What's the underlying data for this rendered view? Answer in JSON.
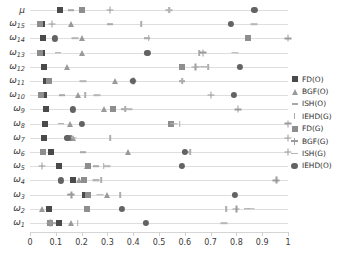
{
  "chart_data": {
    "type": "scatter",
    "title": "",
    "xlabel": "",
    "ylabel": "",
    "xlim": [
      0,
      1
    ],
    "xticks": [
      "0",
      "0.1",
      "0.2",
      "0.3",
      "0.4",
      "0.5",
      "0.6",
      "0.7",
      "0.8",
      "0.9",
      "1"
    ],
    "grid": true,
    "legend_position": "right",
    "categories": [
      "μ",
      "ω₁₅",
      "ω₁₄",
      "ω₁₃",
      "ω₁₂",
      "ω₁₁",
      "ω₁₀",
      "ω₉",
      "ω₈",
      "ω₇",
      "ω₆",
      "ω₅",
      "ω₄",
      "ω₃",
      "ω₂",
      "ω₁"
    ],
    "category_labels": [
      {
        "base": "μ",
        "sub": ""
      },
      {
        "base": "ω",
        "sub": "15"
      },
      {
        "base": "ω",
        "sub": "14"
      },
      {
        "base": "ω",
        "sub": "13"
      },
      {
        "base": "ω",
        "sub": "12"
      },
      {
        "base": "ω",
        "sub": "11"
      },
      {
        "base": "ω",
        "sub": "10"
      },
      {
        "base": "ω",
        "sub": "9"
      },
      {
        "base": "ω",
        "sub": "8"
      },
      {
        "base": "ω",
        "sub": "7"
      },
      {
        "base": "ω",
        "sub": "6"
      },
      {
        "base": "ω",
        "sub": "5"
      },
      {
        "base": "ω",
        "sub": "4"
      },
      {
        "base": "ω",
        "sub": "3"
      },
      {
        "base": "ω",
        "sub": "2"
      },
      {
        "base": "ω",
        "sub": "1"
      }
    ],
    "series": [
      {
        "name": "FD(O)",
        "marker": "square",
        "color": "#4a4a4a",
        "values": [
          0.115,
          0.045,
          0.05,
          0.047,
          0.055,
          0.063,
          0.053,
          0.062,
          0.06,
          0.053,
          0.08,
          0.112,
          0.165,
          0.215,
          0.073,
          0.112
        ]
      },
      {
        "name": "BGF(O)",
        "marker": "triangle",
        "color": "#9a9a9a",
        "values": [
          0.2,
          0.16,
          0.2,
          0.2,
          0.145,
          0.33,
          0.185,
          0.285,
          0.155,
          0.165,
          0.38,
          0.22,
          0.19,
          0.3,
          0.045,
          0.16
        ]
      },
      {
        "name": "ISH(O)",
        "marker": "dash",
        "color": "#a8a8a8",
        "values": [
          0.16,
          0.31,
          0.455,
          0.11,
          0.675,
          0.59,
          0.125,
          0.365,
          0.12,
          0.145,
          0.205,
          0.255,
          0.255,
          0.155,
          0.84,
          0.088
        ]
      },
      {
        "name": "IEHD(G)",
        "marker": "tick",
        "color": "#adadad",
        "values": [
          0.54,
          0.43,
          0.46,
          0.655,
          0.69,
          0.59,
          0.215,
          0.37,
          0.58,
          0.31,
          0.62,
          0.285,
          0.275,
          0.35,
          0.76,
          0.185
        ]
      },
      {
        "name": "FD(G)",
        "marker": "square-g",
        "color": "#8e8e8e",
        "values": [
          0.2,
          0.04,
          0.845,
          0.04,
          0.59,
          0.075,
          0.043,
          0.32,
          0.545,
          0.15,
          0.05,
          0.225,
          0.21,
          0.225,
          0.22,
          0.078
        ]
      },
      {
        "name": "BGF(G)",
        "marker": "plus",
        "color": "#9b9b9b",
        "values": [
          0.31,
          0.085,
          1.0,
          0.67,
          0.64,
          0.4,
          0.7,
          0.805,
          1.0,
          1.0,
          1.0,
          0.045,
          0.955,
          0.16,
          0.8,
          0.078
        ]
      },
      {
        "name": "ISH(G)",
        "marker": "dash-g",
        "color": "#b5b5b5",
        "values": [
          0.54,
          0.87,
          0.175,
          0.795,
          0.65,
          0.205,
          0.26,
          0.385,
          0.56,
          0.165,
          0.605,
          0.3,
          0.255,
          0.27,
          0.855,
          0.75
        ]
      },
      {
        "name": "IEHD(O)",
        "marker": "circle",
        "color": "#636363",
        "values": [
          0.87,
          0.78,
          0.095,
          0.455,
          0.815,
          0.4,
          0.79,
          0.165,
          0.2,
          0.145,
          0.6,
          0.59,
          0.12,
          0.795,
          0.355,
          0.45
        ]
      }
    ]
  },
  "legend": {
    "items": [
      {
        "label": "FD(O)"
      },
      {
        "label": "BGF(O)"
      },
      {
        "label": "ISH(O)"
      },
      {
        "label": "IEHD(G)"
      },
      {
        "label": "FD(G)"
      },
      {
        "label": "BGF(G)"
      },
      {
        "label": "ISH(G)"
      },
      {
        "label": "IEHD(O)"
      }
    ]
  }
}
